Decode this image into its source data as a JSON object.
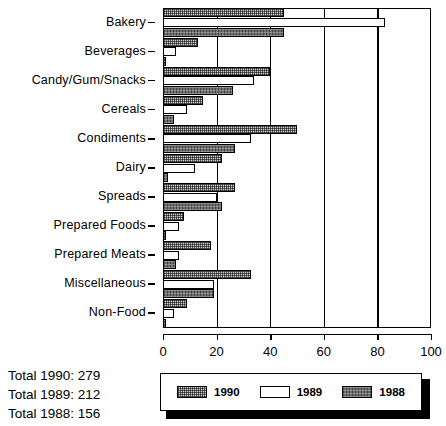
{
  "chart_data": {
    "type": "bar",
    "orientation": "horizontal",
    "title": "",
    "xlabel": "",
    "ylabel": "",
    "xlim": [
      0,
      100
    ],
    "xticks": [
      0,
      20,
      40,
      60,
      80,
      100
    ],
    "xtick_labels": [
      "0",
      "20",
      "40",
      "60",
      "80",
      "100"
    ],
    "grid": true,
    "grid_axis": "x",
    "legend_position": "bottom",
    "categories": [
      "Bakery",
      "Beverages",
      "Candy/Gum/Snacks",
      "Cereals",
      "Condiments",
      "Dairy",
      "Spreads",
      "Prepared Foods",
      "Prepared Meats",
      "Miscellaneous",
      "Non-Food"
    ],
    "series": [
      {
        "name": "1990",
        "style": "light-stipple",
        "values": [
          45,
          13,
          40,
          15,
          50,
          22,
          27,
          8,
          18,
          33,
          9
        ]
      },
      {
        "name": "1989",
        "style": "white",
        "values": [
          83,
          5,
          34,
          9,
          33,
          12,
          20,
          6,
          6,
          19,
          4
        ]
      },
      {
        "name": "1988",
        "style": "dark-gray",
        "values": [
          45,
          1,
          26,
          4,
          27,
          2,
          22,
          1,
          5,
          19,
          1
        ]
      }
    ]
  },
  "totals": {
    "lines": [
      "Total 1990: 279",
      "Total 1989: 212",
      "Total 1988: 156"
    ]
  },
  "legend": {
    "items": [
      {
        "label": "1990",
        "style": "y1990"
      },
      {
        "label": "1989",
        "style": "y1989"
      },
      {
        "label": "1988",
        "style": "y1988"
      }
    ]
  },
  "colors": {
    "axis": "#000000",
    "series_1990": "#cfcfcf",
    "series_1989": "#ffffff",
    "series_1988": "#6e6e6e"
  }
}
